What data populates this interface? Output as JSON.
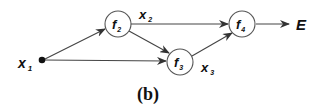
{
  "diagram": {
    "caption": "(b)",
    "nodes": {
      "x1": {
        "label": "x",
        "sub": "1"
      },
      "f2": {
        "label": "f",
        "sub": "2"
      },
      "f3": {
        "label": "f",
        "sub": "3"
      },
      "f4": {
        "label": "f",
        "sub": "4"
      },
      "E": {
        "label": "E"
      }
    },
    "edge_labels": {
      "x2": {
        "label": "x",
        "sub": "2"
      },
      "x3": {
        "label": "x",
        "sub": "3"
      }
    },
    "edges": [
      {
        "from": "x1",
        "to": "f2"
      },
      {
        "from": "x1",
        "to": "f3"
      },
      {
        "from": "f2",
        "to": "f4",
        "label": "x2"
      },
      {
        "from": "f2",
        "to": "f3"
      },
      {
        "from": "f3",
        "to": "f4",
        "label": "x3"
      },
      {
        "from": "f4",
        "to": "E"
      }
    ]
  }
}
